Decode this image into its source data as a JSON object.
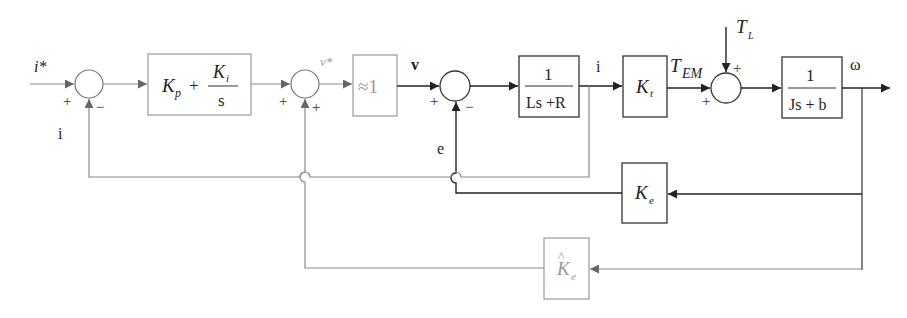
{
  "diagram": {
    "type": "control block diagram",
    "signals": {
      "input": "i*",
      "i_feedback": "i",
      "v_star": "v*",
      "v": "v",
      "e": "e",
      "i": "i",
      "t_em": "T",
      "t_em_sub": "EM",
      "t_l": "T",
      "t_l_sub": "L",
      "omega": "ω"
    },
    "blocks": {
      "pi": {
        "kp": "K",
        "kp_sub": "p",
        "plus": "+",
        "ki": "K",
        "ki_sub": "i",
        "den": "s"
      },
      "approx": {
        "label": "≈1"
      },
      "electrical": {
        "num": "1",
        "den": "Ls +R"
      },
      "torque_const": {
        "label": "K",
        "sub": "t"
      },
      "mechanical": {
        "num": "1",
        "den": "Js + b"
      },
      "back_emf": {
        "label": "K",
        "sub": "e"
      },
      "back_emf_est": {
        "label": "K",
        "hat": "^",
        "sub": "e"
      }
    },
    "signs": {
      "sum1_left": "+",
      "sum1_bottom": "−",
      "sum2_left": "+",
      "sum2_bottom": "+",
      "sum3_left": "+",
      "sum3_bottom": "−",
      "sum4_left": "+",
      "sum4_top": "+"
    }
  }
}
